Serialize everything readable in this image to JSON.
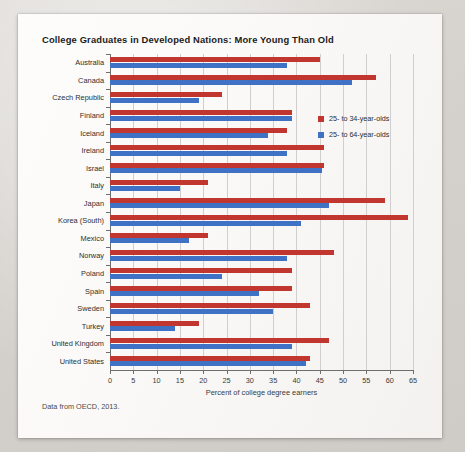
{
  "card": {
    "title": "College Graduates in Developed Nations: More Young Than Old",
    "caption": "Data from OECD, 2013."
  },
  "legend": {
    "position": "inside-top-right",
    "entries": [
      {
        "label": "25- to 34-year-olds",
        "color": "#c1372f"
      },
      {
        "label": "25- to 64-year-olds",
        "color": "#3f72c4"
      }
    ]
  },
  "chart_data": {
    "type": "bar",
    "orientation": "horizontal",
    "title": "College Graduates in Developed Nations: More Young Than Old",
    "xlabel": "Percent of college degree earners",
    "ylabel": "",
    "xlim": [
      0,
      65
    ],
    "xticks": [
      0,
      5,
      10,
      15,
      20,
      25,
      30,
      35,
      40,
      45,
      50,
      55,
      60,
      65
    ],
    "grid": true,
    "grid_axis": "x",
    "legend_position": "inside-top-right",
    "categories": [
      "Australia",
      "Canada",
      "Czech Republic",
      "Finland",
      "Iceland",
      "Ireland",
      "Israel",
      "Italy",
      "Japan",
      "Korea (South)",
      "Mexico",
      "Norway",
      "Poland",
      "Spain",
      "Sweden",
      "Turkey",
      "United Kingdom",
      "United States"
    ],
    "series": [
      {
        "name": "25- to 34-year-olds",
        "color": "#c1372f",
        "values": [
          45,
          57,
          24,
          39,
          38,
          46,
          46,
          21,
          59,
          64,
          21,
          48,
          39,
          39,
          43,
          19,
          47,
          43
        ]
      },
      {
        "name": "25- to 64-year-olds",
        "color": "#3f72c4",
        "values": [
          38,
          52,
          19,
          39,
          34,
          38,
          45.5,
          15,
          47,
          41,
          17,
          38,
          24,
          32,
          35,
          14,
          39,
          42
        ]
      }
    ],
    "annotations": [
      "Data from OECD, 2013."
    ]
  }
}
